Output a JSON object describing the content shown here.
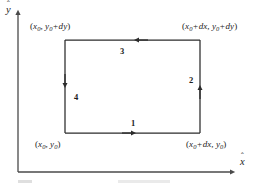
{
  "figure": {
    "type": "contour-integral-diagram",
    "axes": {
      "x_label": "x",
      "x_label_hat": "ˆ",
      "y_label": "y",
      "y_label_hat": "ˆ",
      "origin_corner": true
    },
    "corner_labels": {
      "bottom_left": {
        "text": "(x0, y0)",
        "parts": [
          "(",
          "x",
          "0",
          ",",
          "y",
          "0",
          ")"
        ]
      },
      "bottom_right": {
        "text": "(x0 + dx, y0)",
        "parts": [
          "(",
          "x",
          "0",
          "+",
          "dx",
          ",",
          "y",
          "0",
          ")"
        ]
      },
      "top_left": {
        "text": "(x0, y0 + dy)",
        "parts": [
          "(",
          "x",
          "0",
          ",",
          "y",
          "0",
          "+",
          "dy",
          ")"
        ]
      },
      "top_right": {
        "text": "(x0 + dx, y0 + dy)",
        "parts": [
          "(",
          "x",
          "0",
          "+",
          "dx",
          ",",
          "y",
          "0",
          "+",
          "dy",
          ")"
        ]
      }
    },
    "segments": [
      {
        "number": "1",
        "edge": "bottom",
        "direction": "rightward"
      },
      {
        "number": "2",
        "edge": "right",
        "direction": "upward"
      },
      {
        "number": "3",
        "edge": "top",
        "direction": "leftward"
      },
      {
        "number": "4",
        "edge": "left",
        "direction": "downward"
      }
    ],
    "colors": {
      "stroke": "#2b2b2b",
      "axis": "#4a4a4a",
      "text": "#242424",
      "background": "#ffffff"
    }
  }
}
